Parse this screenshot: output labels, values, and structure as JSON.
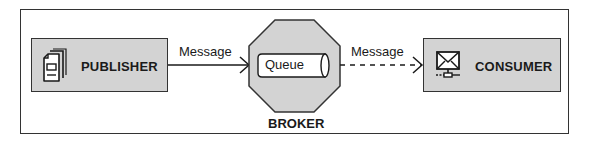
{
  "diagram": {
    "type": "message-queue-architecture",
    "nodes": {
      "publisher": {
        "label": "PUBLISHER",
        "icon": "document-icon"
      },
      "broker": {
        "label": "BROKER",
        "shape": "octagon",
        "inner": {
          "label": "Queue",
          "shape": "cylinder"
        }
      },
      "consumer": {
        "label": "CONSUMER",
        "icon": "networked-mail-icon"
      }
    },
    "edges": [
      {
        "from": "publisher",
        "to": "broker",
        "label": "Message",
        "style": "solid"
      },
      {
        "from": "broker",
        "to": "consumer",
        "label": "Message",
        "style": "dashed"
      }
    ],
    "colors": {
      "node_fill": "#d3d3d3",
      "stroke": "#333333",
      "background": "#ffffff",
      "queue_fill": "#ffffff"
    }
  }
}
